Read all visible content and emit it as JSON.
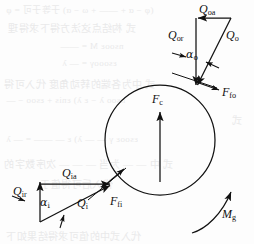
{
  "figure": {
    "kind": "free-body-diagram",
    "background_color": "#fdfdfd",
    "ink_color": "#111111",
    "bleed_color": "#e9e9ea"
  },
  "ball": {
    "name": "ball",
    "center_x": 160,
    "center_y": 140,
    "radius": 55
  },
  "labels": {
    "q_oa": "Q",
    "q_oa_sub": "oa",
    "q_or": "Q",
    "q_or_sub": "or",
    "q_o": "Q",
    "q_o_sub": "o",
    "alpha_o": "α",
    "alpha_o_sub": "o",
    "f_fo": "F",
    "f_fo_sub": "fo",
    "f_c": "F",
    "f_c_sub": "c",
    "q_ia": "Q",
    "q_ia_sub": "ia",
    "q_ir": "Q",
    "q_ir_sub": "ir",
    "q_i": "Q",
    "q_i_sub": "i",
    "alpha_i": "α",
    "alpha_i_sub": "i",
    "f_fi": "F",
    "f_fi_sub": "fi",
    "m_g": "M",
    "m_g_sub": "g"
  },
  "outer_contact": {
    "name": "outer-raceway-contact",
    "contact_x": 196,
    "contact_y": 87,
    "apex_x": 196,
    "apex_y": 18,
    "axial_start_x": 230,
    "axial_start_y": 18
  },
  "inner_contact": {
    "name": "inner-raceway-contact",
    "contact_x": 111,
    "contact_y": 184,
    "apex_x": 40,
    "apex_y": 222,
    "axial_start_x": 40,
    "axial_start_y": 184
  },
  "centrifugal": {
    "name": "centrifugal-force-arrow",
    "tail_x": 160,
    "tail_y": 182,
    "head_x": 160,
    "head_y": 112
  },
  "gyroscopic": {
    "name": "gyroscopic-moment-arc",
    "start_x": 196,
    "start_y": 232,
    "end_x": 232,
    "end_y": 190
  },
  "bleed_text": [
    {
      "text": "(φ − α + —— + ω − α)  于等于可 = φ",
      "x": 6,
      "y": 3,
      "size": 9
    },
    {
      "text": "式 构结点这法方得下求得理",
      "x": 8,
      "y": 20,
      "size": 10
    },
    {
      "text": "nsooε Μ = ——",
      "x": 60,
      "y": 41,
      "size": 9
    },
    {
      "text": "εsoooγ = — λ",
      "x": 62,
      "y": 58,
      "size": 9
    },
    {
      "text": "式 中为各端的转动角度 代入可得",
      "x": 4,
      "y": 76,
      "size": 10
    },
    {
      "text": "nsoo λ − ε λ) εnis + εsoo − —",
      "x": 6,
      "y": 95,
      "size": 9
    },
    {
      "text": "式",
      "x": 232,
      "y": 112,
      "size": 10
    },
    {
      "text": "εsooε γ — — λ) ε — —— = — λ",
      "x": 6,
      "y": 134,
      "size": 9
    },
    {
      "text": "式 中 — — 为当 — — — 次序数字的",
      "x": 4,
      "y": 156,
      "size": 10
    },
    {
      "text": "代入后可得值于",
      "x": 40,
      "y": 176,
      "size": 10
    },
    {
      "text": "代入式中的值可求得结果如下",
      "x": 6,
      "y": 228,
      "size": 10
    }
  ]
}
